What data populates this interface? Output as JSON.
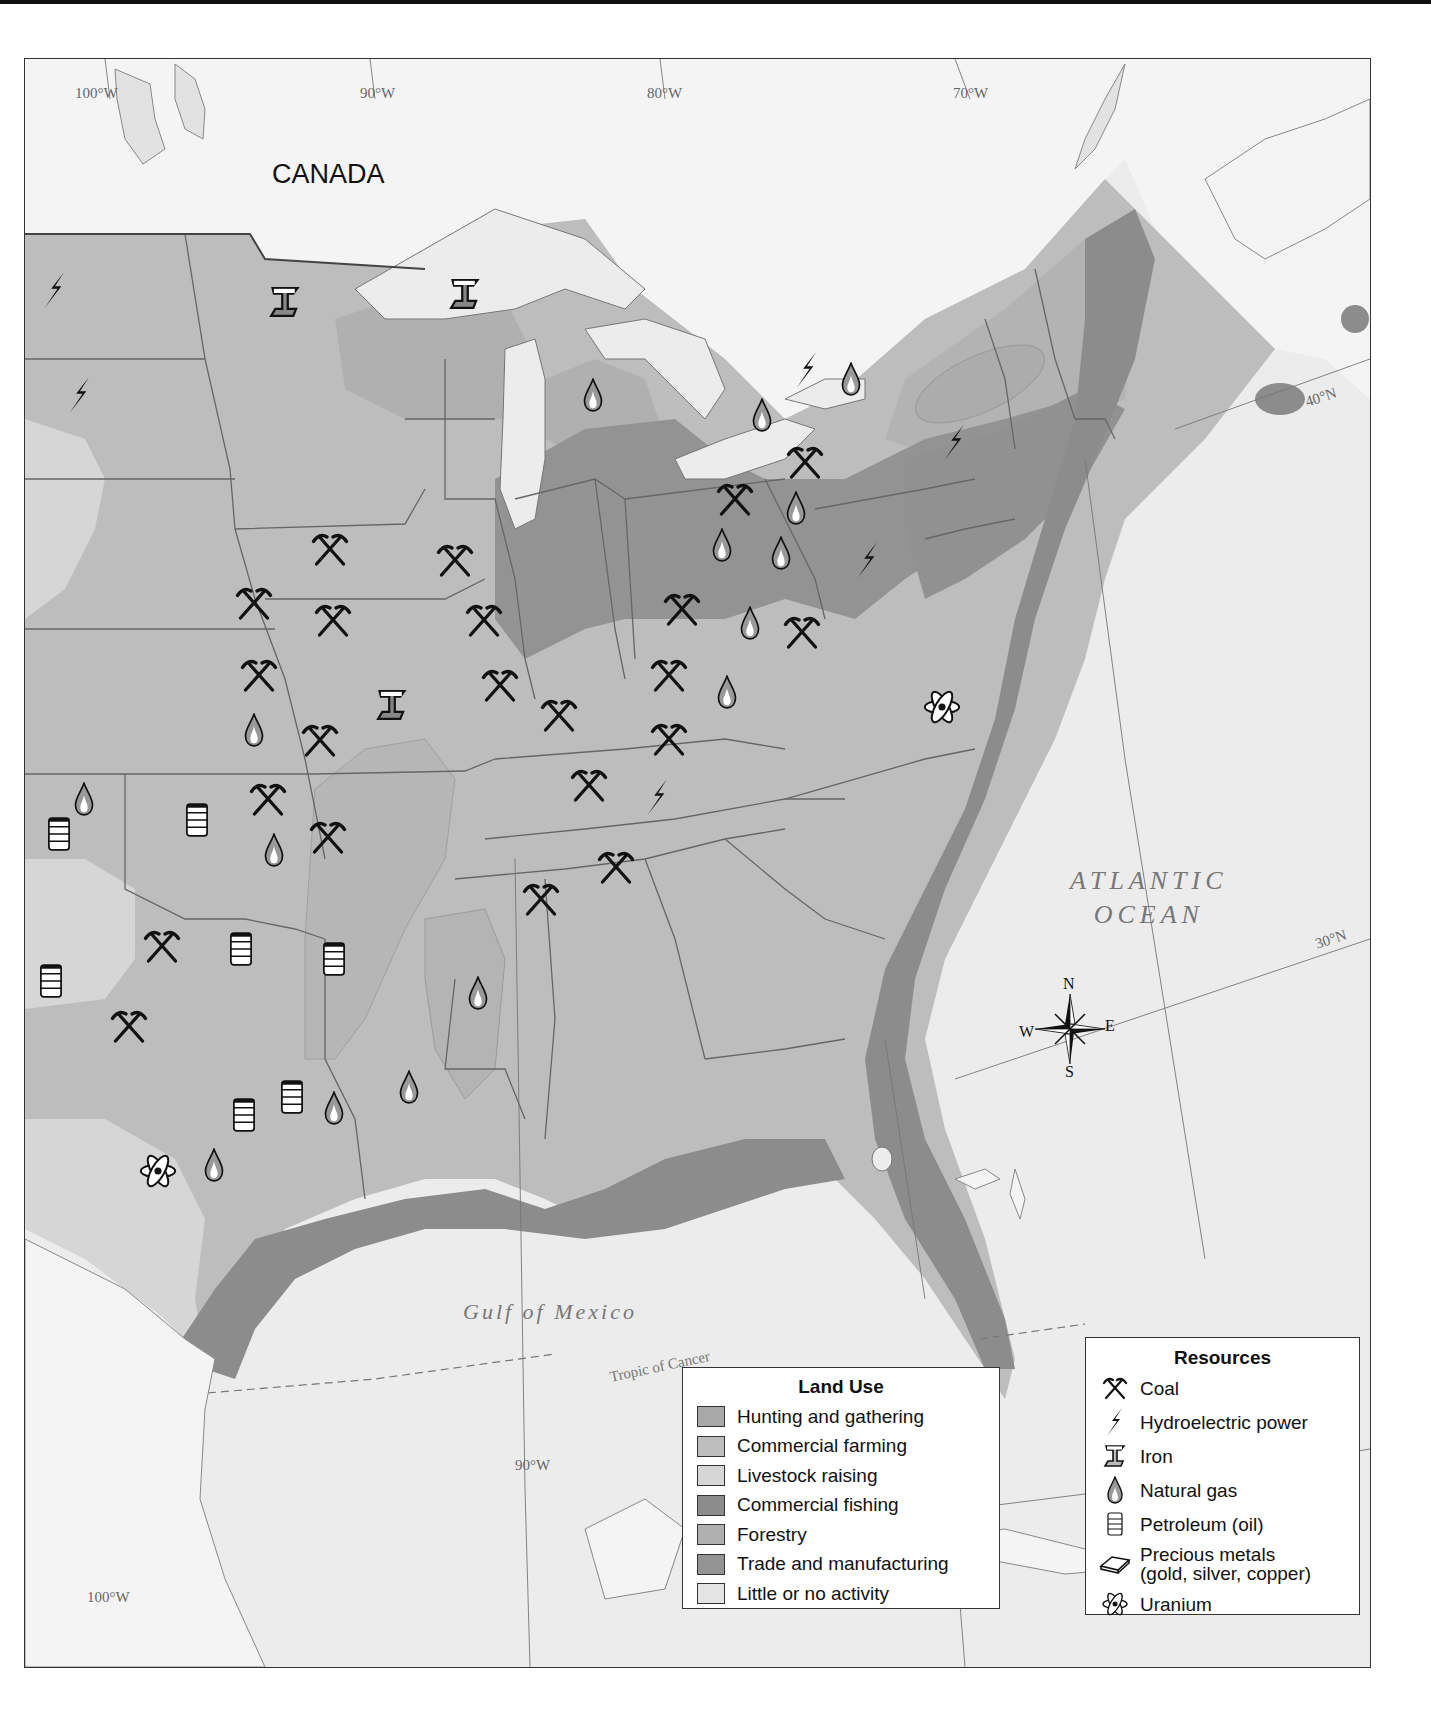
{
  "map": {
    "country_label": "CANADA",
    "ocean_label_line1": "ATLANTIC",
    "ocean_label_line2": "OCEAN",
    "gulf_label": "Gulf of Mexico",
    "tropic_label": "Tropic of Cancer",
    "longitude_labels": {
      "top_100w": "100°W",
      "top_90w": "90°W",
      "top_80w": "80°W",
      "top_70w": "70°W",
      "bottom_100w": "100°W",
      "bottom_90w": "90°W"
    },
    "latitude_labels": {
      "lat_40n": "40°N",
      "lat_30n": "30°N",
      "lat_20n": "20°N"
    },
    "compass": {
      "n": "N",
      "s": "S",
      "e": "E",
      "w": "W"
    }
  },
  "land_use_legend": {
    "title": "Land Use",
    "items": [
      {
        "label": "Hunting and gathering",
        "color": "#a8a8a8"
      },
      {
        "label": "Commercial farming",
        "color": "#bdbdbd"
      },
      {
        "label": "Livestock raising",
        "color": "#d6d6d6"
      },
      {
        "label": "Commercial fishing",
        "color": "#8c8c8c"
      },
      {
        "label": "Forestry",
        "color": "#b0b0b0"
      },
      {
        "label": "Trade and manufacturing",
        "color": "#939393"
      },
      {
        "label": "Little or no activity",
        "color": "#e4e4e4"
      }
    ]
  },
  "resources_legend": {
    "title": "Resources",
    "items": [
      {
        "label": "Coal",
        "icon": "coal-icon"
      },
      {
        "label": "Hydroelectric power",
        "icon": "hydroelectric-icon"
      },
      {
        "label": "Iron",
        "icon": "iron-icon"
      },
      {
        "label": "Natural gas",
        "icon": "natural-gas-icon"
      },
      {
        "label": "Petroleum (oil)",
        "icon": "petroleum-icon"
      },
      {
        "label": "Precious metals",
        "label_line2": "(gold, silver, copper)",
        "icon": "precious-metals-icon"
      },
      {
        "label": "Uranium",
        "icon": "uranium-icon"
      }
    ]
  },
  "colors": {
    "water": "#ececec",
    "canada_land": "#f4f4f4",
    "lakes": "#e6e6e6",
    "commercial_farming": "#bdbdbd",
    "livestock": "#d6d6d6",
    "forestry": "#b0b0b0",
    "trade_manufacturing": "#939393",
    "fishing": "#8c8c8c",
    "border": "#555555"
  }
}
